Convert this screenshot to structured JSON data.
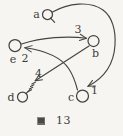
{
  "figure": {
    "caption": {
      "kanji": "図",
      "number": "13"
    },
    "colors": {
      "ink": "#454440",
      "paper": "#f6f5f1"
    },
    "nodes": [
      {
        "id": "a",
        "label": "a"
      },
      {
        "id": "b",
        "label": "b"
      },
      {
        "id": "c",
        "label": "c"
      },
      {
        "id": "d",
        "label": "d"
      },
      {
        "id": "e",
        "label": "e"
      }
    ],
    "edges": [
      {
        "from": "a",
        "to": "c",
        "label": "1"
      },
      {
        "from": "c",
        "to": "e",
        "label": "2"
      },
      {
        "from": "e",
        "to": "b",
        "label": "3"
      },
      {
        "from": "b",
        "to": "d",
        "label": "4"
      }
    ]
  }
}
